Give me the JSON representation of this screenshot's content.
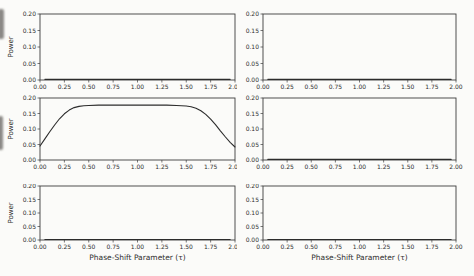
{
  "figure": {
    "background": "#fbfbf9",
    "line_color": "#2c2c2c",
    "axis_color": "#3d3d3d",
    "tick_label_color": "#2e2e2e",
    "ylabel_text": "Power",
    "xlabel_text": "Phase-Shift Parameter (τ)"
  },
  "chart_data": [
    {
      "id": "r1c1",
      "type": "line",
      "row": 0,
      "col": 0,
      "title": "",
      "xlabel": "",
      "ylabel": "Power",
      "xlim": [
        0.0,
        2.0
      ],
      "ylim": [
        0.0,
        0.2
      ],
      "grid": false,
      "legend": "none",
      "xticks": [
        "0.00",
        "0.25",
        "0.50",
        "0.75",
        "1.00",
        "1.25",
        "1.50",
        "1.75",
        "2.00"
      ],
      "yticks": [
        "0.00",
        "0.05",
        "0.10",
        "0.15",
        "0.20"
      ],
      "series": [
        {
          "name": "power",
          "x": [
            0.05,
            1.95
          ],
          "y": [
            0.002,
            0.002
          ]
        }
      ]
    },
    {
      "id": "r1c2",
      "type": "line",
      "row": 0,
      "col": 1,
      "title": "",
      "xlabel": "",
      "ylabel": "",
      "xlim": [
        0.0,
        2.0
      ],
      "ylim": [
        0.0,
        0.2
      ],
      "grid": false,
      "legend": "none",
      "xticks": [
        "0.00",
        "0.25",
        "0.50",
        "0.75",
        "1.00",
        "1.25",
        "1.50",
        "1.75",
        "2.00"
      ],
      "yticks": [
        "0.00",
        "0.05",
        "0.10",
        "0.15",
        "0.20"
      ],
      "series": [
        {
          "name": "power",
          "x": [
            0.05,
            1.95
          ],
          "y": [
            0.002,
            0.002
          ]
        }
      ]
    },
    {
      "id": "r2c1",
      "type": "line",
      "row": 1,
      "col": 0,
      "title": "",
      "xlabel": "",
      "ylabel": "Power",
      "xlim": [
        0.0,
        2.0
      ],
      "ylim": [
        0.0,
        0.2
      ],
      "grid": false,
      "legend": "none",
      "xticks": [
        "0.00",
        "0.25",
        "0.50",
        "0.75",
        "1.00",
        "1.25",
        "1.50",
        "1.75",
        "2.00"
      ],
      "yticks": [
        "0.00",
        "0.05",
        "0.10",
        "0.15",
        "0.20"
      ],
      "series": [
        {
          "name": "power",
          "x": [
            0.0,
            0.05,
            0.1,
            0.15,
            0.2,
            0.25,
            0.3,
            0.35,
            0.4,
            0.45,
            0.5,
            0.6,
            0.7,
            0.8,
            0.9,
            1.0,
            1.1,
            1.2,
            1.3,
            1.4,
            1.5,
            1.55,
            1.6,
            1.65,
            1.7,
            1.75,
            1.8,
            1.85,
            1.9,
            1.95,
            2.0
          ],
          "y": [
            0.045,
            0.068,
            0.091,
            0.113,
            0.133,
            0.149,
            0.161,
            0.169,
            0.173,
            0.175,
            0.176,
            0.177,
            0.177,
            0.177,
            0.177,
            0.177,
            0.177,
            0.177,
            0.177,
            0.176,
            0.174,
            0.172,
            0.167,
            0.159,
            0.147,
            0.132,
            0.114,
            0.094,
            0.075,
            0.057,
            0.042
          ]
        }
      ]
    },
    {
      "id": "r2c2",
      "type": "line",
      "row": 1,
      "col": 1,
      "title": "",
      "xlabel": "",
      "ylabel": "",
      "xlim": [
        0.0,
        2.0
      ],
      "ylim": [
        0.0,
        0.2
      ],
      "grid": false,
      "legend": "none",
      "xticks": [
        "0.00",
        "0.25",
        "0.50",
        "0.75",
        "1.00",
        "1.25",
        "1.50",
        "1.75",
        "2.00"
      ],
      "yticks": [
        "0.00",
        "0.05",
        "0.10",
        "0.15",
        "0.20"
      ],
      "series": [
        {
          "name": "power",
          "x": [
            0.05,
            1.95
          ],
          "y": [
            0.002,
            0.002
          ]
        }
      ]
    },
    {
      "id": "r3c1",
      "type": "line",
      "row": 2,
      "col": 0,
      "title": "",
      "xlabel": "Phase-Shift Parameter (τ)",
      "ylabel": "Power",
      "xlim": [
        0.0,
        2.0
      ],
      "ylim": [
        0.0,
        0.2
      ],
      "grid": false,
      "legend": "none",
      "xticks": [
        "0.00",
        "0.25",
        "0.50",
        "0.75",
        "1.00",
        "1.25",
        "1.50",
        "1.75",
        "2.00"
      ],
      "yticks": [
        "0.00",
        "0.05",
        "0.10",
        "0.15",
        "0.20"
      ],
      "series": [
        {
          "name": "power",
          "x": [
            0.05,
            1.95
          ],
          "y": [
            0.002,
            0.002
          ]
        }
      ]
    },
    {
      "id": "r3c2",
      "type": "line",
      "row": 2,
      "col": 1,
      "title": "",
      "xlabel": "Phase-Shift Parameter (τ)",
      "ylabel": "",
      "xlim": [
        0.0,
        2.0
      ],
      "ylim": [
        0.0,
        0.2
      ],
      "grid": false,
      "legend": "none",
      "xticks": [
        "0.00",
        "0.25",
        "0.50",
        "0.75",
        "1.00",
        "1.25",
        "1.50",
        "1.75",
        "2.00"
      ],
      "yticks": [
        "0.00",
        "0.05",
        "0.10",
        "0.15",
        "0.20"
      ],
      "series": [
        {
          "name": "power",
          "x": [
            0.05,
            1.95
          ],
          "y": [
            0.002,
            0.002
          ]
        }
      ]
    }
  ]
}
